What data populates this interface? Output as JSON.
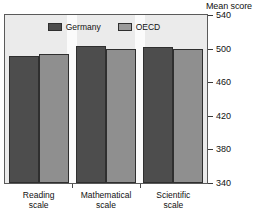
{
  "chart_data": {
    "type": "bar",
    "title": "",
    "axis_title": "Mean score",
    "xlabel": "",
    "ylabel": "Mean score",
    "categories": [
      "Reading scale",
      "Mathematical scale",
      "Scientific scale"
    ],
    "category_lines": [
      [
        "Reading",
        "scale"
      ],
      [
        "Mathematical",
        "scale"
      ],
      [
        "Scientific",
        "scale"
      ]
    ],
    "series": [
      {
        "name": "Germany",
        "color": "#4d4d4d",
        "values": [
          491,
          503,
          502
        ]
      },
      {
        "name": "OECD",
        "color": "#8f8f8f",
        "values": [
          494,
          500,
          500
        ]
      }
    ],
    "ylim": [
      340,
      540
    ],
    "ytick_values": [
      540,
      500,
      460,
      420,
      380,
      340
    ],
    "ytick_labels": [
      "540",
      "500",
      "460",
      "420",
      "380",
      "340"
    ],
    "grid": false,
    "legend_position": "top-center",
    "legend_entries": [
      "Germany",
      "OECD"
    ]
  },
  "legend": {
    "items": [
      {
        "label": "Germany",
        "swatch": "legend-swatch-germany"
      },
      {
        "label": "OECD",
        "swatch": "legend-swatch-oecd"
      }
    ]
  },
  "axis": {
    "title": "Mean score",
    "ticks": [
      "540",
      "500",
      "460",
      "420",
      "380",
      "340"
    ]
  }
}
